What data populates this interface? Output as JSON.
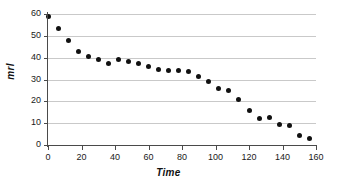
{
  "chart_data": {
    "type": "scatter",
    "title": "",
    "xlabel": "Time",
    "ylabel": "mrl",
    "xlim": [
      0,
      160
    ],
    "ylim": [
      0,
      60
    ],
    "xticks": [
      0,
      20,
      40,
      60,
      80,
      100,
      120,
      140,
      160
    ],
    "xtick_labels": [
      "0",
      "20",
      "40",
      "60",
      "80",
      "100",
      "120",
      "140",
      "160"
    ],
    "yticks": [
      0,
      10,
      20,
      30,
      40,
      50,
      60
    ],
    "ytick_labels": [
      "0",
      "10",
      "20",
      "30",
      "40",
      "50",
      "60"
    ],
    "grid": "horizontal",
    "legend": "none",
    "marker": "filled-diamond",
    "marker_color": "#111111",
    "gridline_color": "#c9c9c9",
    "axis_color": "#4a4a4a",
    "background_color": "#ffffff",
    "series": [
      {
        "name": "mrl",
        "points": [
          [
            0,
            59.0
          ],
          [
            6,
            53.3
          ],
          [
            12,
            48.0
          ],
          [
            18,
            43.0
          ],
          [
            24,
            40.5
          ],
          [
            30,
            39.3
          ],
          [
            36,
            37.3
          ],
          [
            42,
            39.1
          ],
          [
            48,
            38.3
          ],
          [
            54,
            37.4
          ],
          [
            60,
            35.8
          ],
          [
            66,
            34.5
          ],
          [
            72,
            34.1
          ],
          [
            78,
            33.9
          ],
          [
            84,
            33.5
          ],
          [
            90,
            31.6
          ],
          [
            96,
            29.1
          ],
          [
            102,
            25.7
          ],
          [
            108,
            24.9
          ],
          [
            114,
            21.0
          ],
          [
            120,
            16.0
          ],
          [
            126,
            12.1
          ],
          [
            132,
            12.8
          ],
          [
            138,
            9.6
          ],
          [
            144,
            9.1
          ],
          [
            150,
            4.3
          ],
          [
            156,
            3.0
          ]
        ]
      }
    ]
  }
}
